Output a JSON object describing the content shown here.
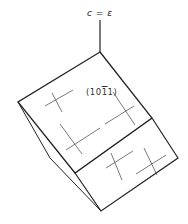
{
  "figure": {
    "axis_label": "c = ε",
    "face_label_prefix": "(10",
    "face_label_bar": "1",
    "face_label_suffix": "1)",
    "stroke_color": "#222222",
    "hatch_color": "#555555"
  }
}
